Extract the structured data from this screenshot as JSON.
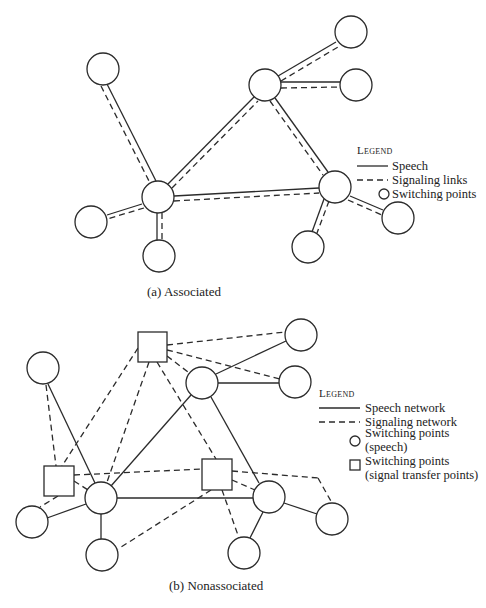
{
  "diagram_a": {
    "caption": "(a) Associated",
    "legend": {
      "title": "Legend",
      "items": [
        {
          "symbol": "solid-line",
          "label": "Speech"
        },
        {
          "symbol": "dashed-line",
          "label": "Signaling links"
        },
        {
          "symbol": "circle",
          "label": "Switching points"
        }
      ]
    },
    "nodes": [
      {
        "id": "a1",
        "shape": "circle",
        "x": 103,
        "y": 69
      },
      {
        "id": "a2",
        "shape": "circle",
        "x": 158,
        "y": 197
      },
      {
        "id": "a3",
        "shape": "circle",
        "x": 91,
        "y": 222
      },
      {
        "id": "a4",
        "shape": "circle",
        "x": 159,
        "y": 256
      },
      {
        "id": "a5",
        "shape": "circle",
        "x": 265,
        "y": 85
      },
      {
        "id": "a6",
        "shape": "circle",
        "x": 351,
        "y": 32
      },
      {
        "id": "a7",
        "shape": "circle",
        "x": 356,
        "y": 85
      },
      {
        "id": "a8",
        "shape": "circle",
        "x": 335,
        "y": 187
      },
      {
        "id": "a9",
        "shape": "circle",
        "x": 308,
        "y": 247
      },
      {
        "id": "a10",
        "shape": "circle",
        "x": 398,
        "y": 218
      }
    ],
    "links": [
      [
        "a1",
        "a2"
      ],
      [
        "a2",
        "a3"
      ],
      [
        "a2",
        "a4"
      ],
      [
        "a2",
        "a5"
      ],
      [
        "a2",
        "a8"
      ],
      [
        "a5",
        "a6"
      ],
      [
        "a5",
        "a7"
      ],
      [
        "a5",
        "a8"
      ],
      [
        "a8",
        "a9"
      ],
      [
        "a8",
        "a10"
      ]
    ]
  },
  "diagram_b": {
    "caption": "(b) Nonassociated",
    "legend": {
      "title": "Legend",
      "items": [
        {
          "symbol": "solid-line",
          "label": "Speech network"
        },
        {
          "symbol": "dashed-line",
          "label": "Signaling network"
        },
        {
          "symbol": "circle",
          "label": "Switching points",
          "label2": "(speech)"
        },
        {
          "symbol": "square",
          "label": "Switching points",
          "label2": "(signal transfer points)"
        }
      ]
    }
  }
}
